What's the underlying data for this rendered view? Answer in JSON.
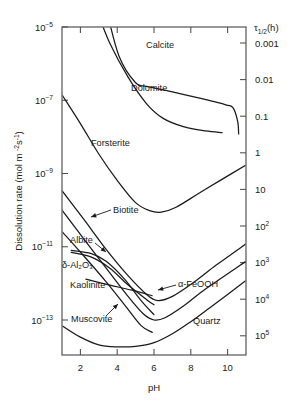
{
  "chart_data": {
    "type": "line",
    "title": "",
    "xlabel": "pH",
    "ylabel": "Dissolution rate (mol m−2s−1)",
    "ylabel_plain": "Dissolution rate",
    "ylabel_units": "(mol m",
    "y2label": "τ1/2(h)",
    "y2label_tau": "τ",
    "y2label_sub": "1/2",
    "y2label_tail": "(h)",
    "xlim": [
      1,
      11
    ],
    "ylim": [
      1e-14,
      1e-05
    ],
    "grid": false,
    "legend": "inline-curve-labels",
    "xticks": [
      "2",
      "4",
      "6",
      "8",
      "10"
    ],
    "xtick_values": [
      2,
      4,
      6,
      8,
      10
    ],
    "yticks": [
      {
        "mantissa": "10",
        "exponent": "−5",
        "value": 1e-05
      },
      {
        "mantissa": "10",
        "exponent": "−7",
        "value": 1e-07
      },
      {
        "mantissa": "10",
        "exponent": "−9",
        "value": 1e-09
      },
      {
        "mantissa": "10",
        "exponent": "−11",
        "value": 1e-11
      },
      {
        "mantissa": "10",
        "exponent": "−13",
        "value": 1e-13
      }
    ],
    "y2ticks": [
      {
        "mantissa": "0.001",
        "exponent": "",
        "value": 0.001
      },
      {
        "mantissa": "0.01",
        "exponent": "",
        "value": 0.01
      },
      {
        "mantissa": "0.1",
        "exponent": "",
        "value": 0.1
      },
      {
        "mantissa": "1",
        "exponent": "",
        "value": 1
      },
      {
        "mantissa": "10",
        "exponent": "",
        "value": 10
      },
      {
        "mantissa": "10",
        "exponent": "2",
        "value": 100
      },
      {
        "mantissa": "10",
        "exponent": "3",
        "value": 1000
      },
      {
        "mantissa": "10",
        "exponent": "4",
        "value": 10000
      },
      {
        "mantissa": "10",
        "exponent": "5",
        "value": 100000
      }
    ],
    "series": [
      {
        "name": "Calcite",
        "label": "Calcite",
        "label_pos": {
          "x": 146,
          "y": 48
        },
        "points": [
          [
            3.4,
            3.2e-05
          ],
          [
            4.1,
            1.6e-06
          ],
          [
            5.0,
            3e-07
          ],
          [
            5.6,
            2.4e-07
          ],
          [
            7.0,
            1.7e-07
          ],
          [
            8.6,
            1.1e-07
          ],
          [
            9.9,
            7.5e-08
          ],
          [
            10.3,
            6.2e-08
          ],
          [
            10.55,
            2.6e-08
          ],
          [
            10.6,
            1.2e-08
          ]
        ]
      },
      {
        "name": "Dolomite",
        "label": "Dolomite",
        "label_pos": {
          "x": 131,
          "y": 91
        },
        "points": [
          [
            2.85,
            3.2e-05
          ],
          [
            3.6,
            3.6e-06
          ],
          [
            4.6,
            4.2e-07
          ],
          [
            5.6,
            8e-08
          ],
          [
            6.5,
            3.2e-08
          ],
          [
            7.6,
            1.9e-08
          ],
          [
            8.8,
            1.45e-08
          ],
          [
            9.7,
            1.3e-08
          ]
        ]
      },
      {
        "name": "Forsterite",
        "label": "Forsterite",
        "label_pos": {
          "x": 91,
          "y": 146
        },
        "points": [
          [
            1.0,
            1.4e-07
          ],
          [
            2.0,
            2.3e-08
          ],
          [
            3.0,
            3.4e-09
          ],
          [
            4.0,
            6.5e-10
          ],
          [
            5.0,
            1.6e-10
          ],
          [
            5.8,
            9.5e-11
          ],
          [
            6.4,
            8.8e-11
          ],
          [
            7.2,
            1.2e-10
          ],
          [
            8.4,
            2.8e-10
          ],
          [
            9.6,
            6.5e-10
          ],
          [
            11.0,
            1.7e-09
          ]
        ]
      },
      {
        "name": "Biotite",
        "label": "Biotite",
        "label_pos": {
          "x": 113,
          "y": 213
        },
        "points": [
          [
            1.0,
            3.4e-10
          ],
          [
            2.2,
            5.5e-11
          ],
          [
            3.4,
            8.5e-12
          ],
          [
            4.6,
            1.6e-12
          ],
          [
            5.6,
            5e-13
          ],
          [
            6.2,
            3.4e-13
          ],
          [
            7.0,
            4.4e-13
          ],
          [
            8.2,
            1.1e-12
          ],
          [
            9.4,
            3.2e-12
          ],
          [
            11.0,
            1.2e-11
          ]
        ]
      },
      {
        "name": "Albite",
        "label": "Albite",
        "label_pos": {
          "x": 70,
          "y": 243
        },
        "points": [
          [
            1.0,
            1e-10
          ],
          [
            2.2,
            1.6e-11
          ],
          [
            3.4,
            2.6e-12
          ],
          [
            4.5,
            5e-13
          ],
          [
            5.4,
            1.5e-13
          ],
          [
            6.0,
            1e-13
          ],
          [
            6.6,
            1.15e-13
          ],
          [
            7.6,
            2.4e-13
          ],
          [
            8.8,
            7e-13
          ],
          [
            11.0,
            4e-12
          ]
        ]
      },
      {
        "name": "δ-Al2O3",
        "label": "δ-Al₂O₃",
        "label_pos": {
          "x": 62,
          "y": 268
        },
        "points": [
          [
            1.0,
            2.6e-11
          ],
          [
            2.2,
            5.5e-12
          ],
          [
            3.4,
            1.1e-12
          ],
          [
            4.4,
            2.6e-13
          ],
          [
            5.3,
            7e-14
          ],
          [
            5.9,
            4.6e-14
          ]
        ]
      },
      {
        "name": "Kaolinite",
        "label": "Kaolinite",
        "label_pos": {
          "x": 70,
          "y": 288
        },
        "points": [
          [
            1.5,
            8e-12
          ],
          [
            2.6,
            6.5e-12
          ],
          [
            3.4,
            4e-12
          ],
          [
            4.4,
            1.3e-12
          ],
          [
            5.3,
            3.4e-13
          ],
          [
            6.0,
            1.4e-13
          ]
        ]
      },
      {
        "name": "Muscovite",
        "label": "Muscovite",
        "label_pos": {
          "x": 71,
          "y": 322
        },
        "points": [
          [
            2.3,
            1.3e-12
          ],
          [
            3.6,
            9e-13
          ],
          [
            4.8,
            6.5e-13
          ],
          [
            5.9,
            4.6e-13
          ]
        ]
      },
      {
        "name": "α-FeOOH",
        "label": "α-FeOOH",
        "label_pos": {
          "x": 178,
          "y": 287
        },
        "points": [
          [
            1.5,
            7e-12
          ],
          [
            2.6,
            5.2e-12
          ],
          [
            3.6,
            2.6e-12
          ],
          [
            4.6,
            9e-13
          ],
          [
            5.6,
            3.6e-13
          ],
          [
            6.0,
            2.6e-13
          ]
        ]
      },
      {
        "name": "Quartz",
        "label": "Quartz",
        "label_pos": {
          "x": 193,
          "y": 324
        },
        "points": [
          [
            1.0,
            7e-14
          ],
          [
            2.0,
            3.4e-14
          ],
          [
            3.0,
            2.1e-14
          ],
          [
            4.0,
            1.85e-14
          ],
          [
            5.0,
            1.9e-14
          ],
          [
            6.0,
            2.4e-14
          ],
          [
            7.0,
            4.2e-14
          ],
          [
            8.0,
            9e-14
          ],
          [
            9.0,
            2.1e-13
          ],
          [
            10.0,
            5e-13
          ],
          [
            11.0,
            1.2e-12
          ]
        ]
      }
    ],
    "annotations": [
      {
        "name": "biotite-leader",
        "label_for": "Biotite",
        "from": [
          111,
          210
        ],
        "to": [
          91,
          217
        ]
      },
      {
        "name": "albite-leader",
        "label_for": "Albite",
        "from": [
          95,
          243
        ],
        "to": [
          106,
          252
        ]
      },
      {
        "name": "muscovite-leader",
        "label_for": "Muscovite",
        "from": [
          106,
          316
        ],
        "to": [
          118,
          304
        ]
      },
      {
        "name": "feooh-leader",
        "label_for": "α-FeOOH",
        "from": [
          176,
          285
        ],
        "to": [
          158,
          290
        ]
      }
    ]
  },
  "accent_colors": {
    "curve": "#1a1a1a",
    "frame": "#4d4d4d",
    "background": "#ffffff"
  }
}
